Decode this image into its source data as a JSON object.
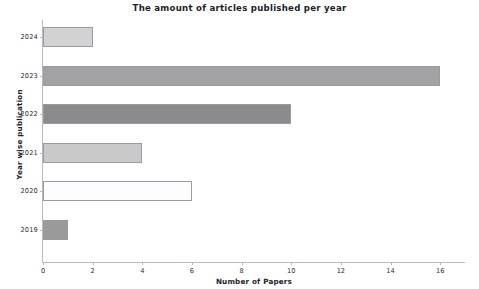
{
  "chart_data": {
    "type": "bar",
    "orientation": "horizontal",
    "title": "The amount of articles published per year",
    "xlabel": "Number of Papers",
    "ylabel": "Year wise publication",
    "categories": [
      "2024",
      "2023",
      "2022",
      "2021",
      "2020",
      "2019"
    ],
    "values": [
      2,
      16,
      10,
      4,
      6,
      1
    ],
    "bar_colors": [
      "#d2d2d2",
      "#a3a3a3",
      "#8b8b8b",
      "#c9c9c9",
      "#fdfdfd",
      "#9a9a9a"
    ],
    "bar_edge_color": "#9a9aa2",
    "xlim": [
      0,
      17
    ],
    "xticks": [
      0,
      2,
      4,
      6,
      8,
      10,
      12,
      14,
      16
    ],
    "xtick_labels": [
      "0",
      "2",
      "4",
      "6",
      "8",
      "10",
      "12",
      "14",
      "16"
    ],
    "grid": false,
    "legend": null,
    "series": [
      {
        "name": "Number of Papers",
        "values": [
          2,
          16,
          10,
          4,
          6,
          1
        ]
      }
    ],
    "points": [
      {
        "year": "2024",
        "papers": 2
      },
      {
        "year": "2023",
        "papers": 16
      },
      {
        "year": "2022",
        "papers": 10
      },
      {
        "year": "2021",
        "papers": 4
      },
      {
        "year": "2020",
        "papers": 6
      },
      {
        "year": "2019",
        "papers": 1
      }
    ]
  }
}
